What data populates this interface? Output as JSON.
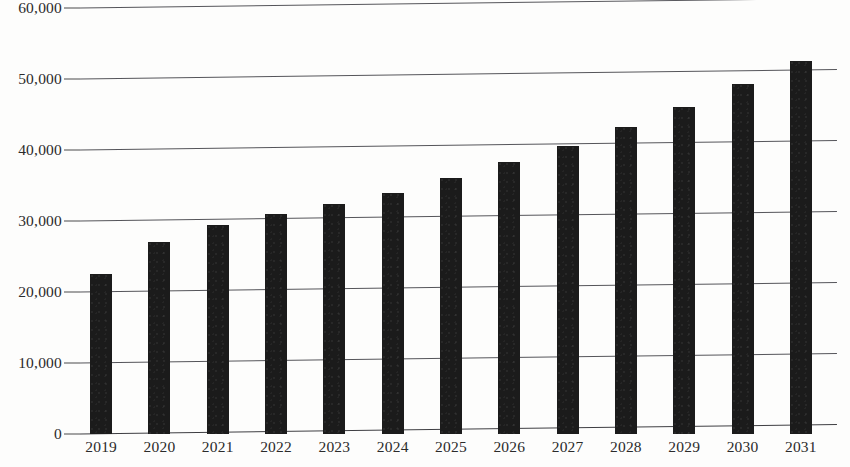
{
  "chart_data": {
    "type": "bar",
    "title": "",
    "subtitle": "",
    "xlabel": "",
    "ylabel": "",
    "categories": [
      "2019",
      "2020",
      "2021",
      "2022",
      "2023",
      "2024",
      "2025",
      "2026",
      "2027",
      "2028",
      "2029",
      "2030",
      "2031"
    ],
    "values": [
      22500,
      27000,
      29400,
      31000,
      32400,
      33900,
      36000,
      38300,
      40500,
      43200,
      46000,
      49300,
      52500
    ],
    "series": [
      {
        "name": "Market size",
        "values": [
          22500,
          27000,
          29400,
          31000,
          32400,
          33900,
          36000,
          38300,
          40500,
          43200,
          46000,
          49300,
          52500
        ]
      }
    ],
    "ylim": [
      0,
      60000
    ],
    "ytick_labels": [
      "0",
      "10,000",
      "20,000",
      "30,000",
      "40,000",
      "50,000",
      "60,000"
    ],
    "ytick_values": [
      0,
      10000,
      20000,
      30000,
      40000,
      50000,
      60000
    ],
    "xtick_labels": [
      "2019",
      "2020",
      "2021",
      "2022",
      "2023",
      "2024",
      "2025",
      "2026",
      "2027",
      "2028",
      "2029",
      "2030",
      "2031"
    ],
    "grid": true,
    "grid_axis": "y",
    "legend": false,
    "legend_position": "none",
    "annotations": [],
    "colors": {
      "bar": "#1b1b1b",
      "grid": "#55555a",
      "axis": "#3e3e42",
      "text": "#2b2b2b",
      "background": "#fdfdfc"
    }
  }
}
